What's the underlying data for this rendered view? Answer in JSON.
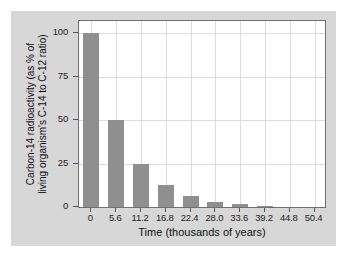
{
  "chart_data": {
    "type": "bar",
    "title": "",
    "xlabel": "Time (thousands of years)",
    "ylabel_line1": "Carbon-14 radioactivity (as % of",
    "ylabel_line2": "living organism's C-14 to C-12 ratio)",
    "categories": [
      "0",
      "5.6",
      "11.2",
      "16.8",
      "22.4",
      "28.0",
      "33.6",
      "39.2",
      "44.8",
      "50.4"
    ],
    "values": [
      100,
      50,
      25,
      12.5,
      6.25,
      3.125,
      1.5625,
      0.78125,
      0.390625,
      0.1953125
    ],
    "xtick_labels": [
      "0",
      "5.6",
      "11.2",
      "16.8",
      "22.4",
      "28.0",
      "33.6",
      "39.2",
      "44.8",
      "50.4"
    ],
    "ytick_labels": [
      "100",
      "75",
      "50",
      "25",
      "0"
    ],
    "ytick_values": [
      100,
      75,
      50,
      25,
      0
    ],
    "ylim": [
      0,
      107
    ],
    "xlim_categories": 10,
    "grid": true,
    "legend": "none",
    "bar_color": "#8f8f8f",
    "panel_color": "#d7d7d7",
    "plot_bg": "#ffffff",
    "grid_color": "#dcdcdc",
    "frame_color": "#6f6f6f"
  }
}
